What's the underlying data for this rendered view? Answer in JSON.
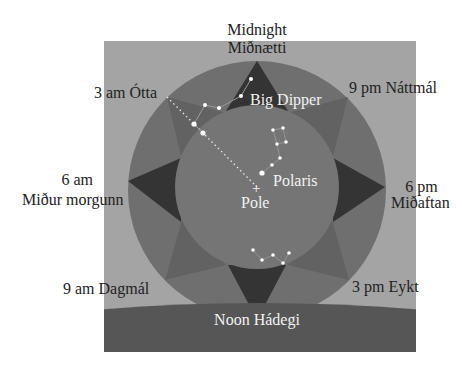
{
  "diagram": {
    "colors": {
      "background": "#ffffff",
      "frame": "#a4a4a4",
      "outer_ring": "#6f6f6f",
      "inner_circle": "#757575",
      "diagonal_points": "#626262",
      "cardinal_points": "#343434",
      "ground": "#565656",
      "star": "#ffffff",
      "text_dark": "#222222",
      "text_light": "#f2f2f2"
    },
    "labels": {
      "top": {
        "line1": "Midnight",
        "line2": "Miðnætti"
      },
      "upper_left": "3 am Ótta",
      "upper_right": "9 pm Náttmál",
      "left": {
        "line1": "6 am",
        "line2": "Miður morgunn"
      },
      "right": {
        "line1": "6 pm",
        "line2": "Miðaftan"
      },
      "lower_left": "9 am Dagmál",
      "lower_right": "3 pm Eykt",
      "bottom": "Noon Hádegi"
    },
    "sky_labels": {
      "big_dipper": "Big Dipper",
      "polaris": "Polaris",
      "pole": "Pole",
      "pole_marker": "+"
    }
  }
}
